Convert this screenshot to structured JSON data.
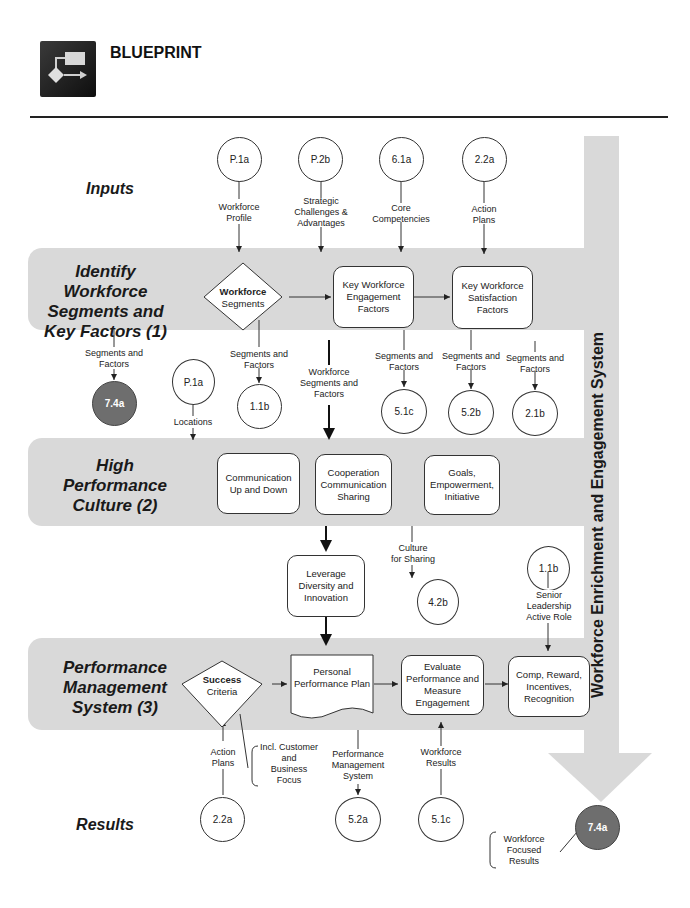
{
  "header": {
    "title": "BLUEPRINT",
    "logo_icon": "flowchart-icon"
  },
  "sections": {
    "inputs": "Inputs",
    "identify": "Identify Workforce Segments and Key Factors (1)",
    "identify_lines": [
      "Identify",
      "Workforce",
      "Segments and",
      "Key Factors (1)"
    ],
    "culture_lines": [
      "High",
      "Performance",
      "Culture (2)"
    ],
    "pms_lines": [
      "Performance",
      "Management",
      "System (3)"
    ],
    "results": "Results"
  },
  "side_bar_label": "Workforce Enrichment and Engagement System",
  "inputs": [
    {
      "id": "P.1a",
      "label": "Workforce Profile",
      "lines": [
        "Workforce",
        "Profile"
      ]
    },
    {
      "id": "P.2b",
      "label": "Strategic Challenges & Advantages",
      "lines": [
        "Strategic",
        "Challenges &",
        "Advantages"
      ]
    },
    {
      "id": "6.1a",
      "label": "Core Competencies",
      "lines": [
        "Core",
        "Competencies"
      ]
    },
    {
      "id": "2.2a",
      "label": "Action Plans",
      "lines": [
        "Action",
        "Plans"
      ]
    }
  ],
  "identify_nodes": {
    "diamond_bold": "Workforce",
    "diamond_rest": "Segments",
    "engagement": "Key Workforce Engagement Factors",
    "satisfaction": "Key Workforce Satisfaction Factors"
  },
  "mid_outputs": [
    {
      "id": "7.4a",
      "label_lines": [
        "Segments and",
        "Factors"
      ],
      "dark": true
    },
    {
      "id": "P.1a",
      "label_lines": [
        "Locations"
      ],
      "dark": false
    },
    {
      "id": "1.1b",
      "label_lines": [
        "Segments and",
        "Factors"
      ],
      "dark": false
    },
    {
      "id": "5.1c",
      "label_lines": [
        "Segments and",
        "Factors"
      ],
      "dark": false
    },
    {
      "id": "5.2b",
      "label_lines": [
        "Segments and",
        "Factors"
      ],
      "dark": false
    },
    {
      "id": "2.1b",
      "label_lines": [
        "Segments and",
        "Factors"
      ],
      "dark": false
    }
  ],
  "flow_label_segments": [
    "Workforce",
    "Segments and",
    "Factors"
  ],
  "culture_nodes": {
    "comm": "Communication Up and Down",
    "coop": "Cooperation Communication Sharing",
    "goals": "Goals, Empowerment, Initiative"
  },
  "between": {
    "leverage": "Leverage Diversity and Innovation",
    "culture_sharing_lines": [
      "Culture",
      "for Sharing"
    ],
    "culture_sharing_ref": "4.2b",
    "senior_ref": "1.1b",
    "senior_lines": [
      "Senior",
      "Leadership",
      "Active Role"
    ]
  },
  "pms_nodes": {
    "diamond_bold": "Success",
    "diamond_rest": "Criteria",
    "personal_plan": "Personal Performance Plan",
    "evaluate": "Evaluate Performance and Measure Engagement",
    "comp": "Comp, Reward, Incentives, Recognition"
  },
  "results_row": {
    "action_plans_lines": [
      "Action",
      "Plans"
    ],
    "action_ref": "2.2a",
    "incl_lines": [
      "Incl. Customer",
      "and",
      "Business",
      "Focus"
    ],
    "pms_lines": [
      "Performance",
      "Management",
      "System"
    ],
    "pms_ref": "5.2a",
    "wr_lines": [
      "Workforce",
      "Results"
    ],
    "wr_ref": "5.1c",
    "final_ref": "7.4a",
    "final_lines": [
      "Workforce",
      "Focused",
      "Results"
    ]
  },
  "colors": {
    "band": "#d9d9d9",
    "dark_circle": "#6e6e6e",
    "line": "#333333"
  }
}
